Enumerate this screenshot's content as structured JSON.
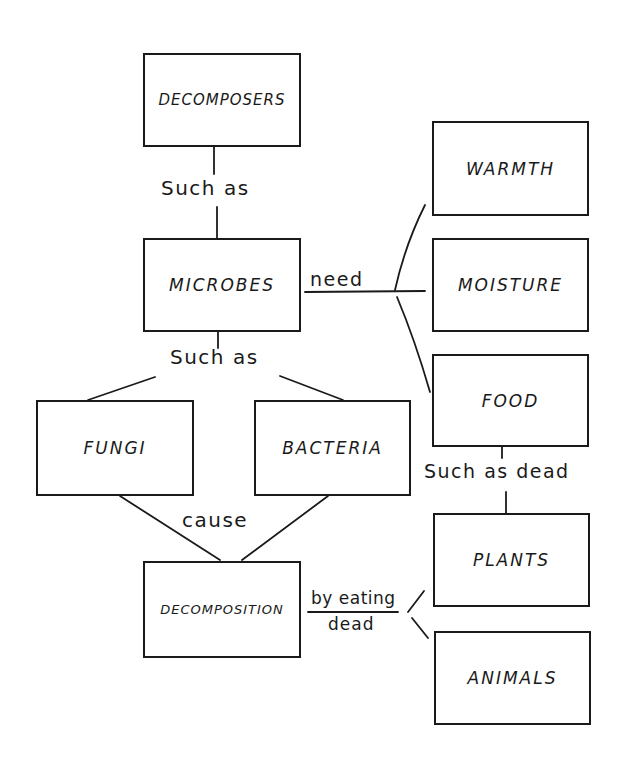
{
  "diagram": {
    "nodes": {
      "decomposers": "DECOMPOSERS",
      "microbes": "MICROBES",
      "warmth": "WARMTH",
      "moisture": "MOISTURE",
      "food": "FOOD",
      "fungi": "FUNGI",
      "bacteria": "BACTERIA",
      "decomposition": "DECOMPOSITION",
      "plants": "PLANTS",
      "animals": "ANIMALS"
    },
    "links": {
      "decomposers_microbes": "Such as",
      "microbes_fungi_bacteria": "Such as",
      "microbes_needs": "need",
      "food_plants": "Such as dead",
      "fungi_bacteria_decomposition": "cause",
      "decomposition_by": "by eating",
      "decomposition_dead": "dead"
    },
    "edges": [
      [
        "DECOMPOSERS",
        "Such as",
        "MICROBES"
      ],
      [
        "MICROBES",
        "need",
        "WARMTH"
      ],
      [
        "MICROBES",
        "need",
        "MOISTURE"
      ],
      [
        "MICROBES",
        "need",
        "FOOD"
      ],
      [
        "MICROBES",
        "Such as",
        "FUNGI"
      ],
      [
        "MICROBES",
        "Such as",
        "BACTERIA"
      ],
      [
        "FUNGI",
        "cause",
        "DECOMPOSITION"
      ],
      [
        "BACTERIA",
        "cause",
        "DECOMPOSITION"
      ],
      [
        "FOOD",
        "Such as dead",
        "PLANTS"
      ],
      [
        "DECOMPOSITION",
        "by eating dead",
        "PLANTS"
      ],
      [
        "DECOMPOSITION",
        "by eating dead",
        "ANIMALS"
      ]
    ],
    "colors": {
      "ink": "#1a1a1a",
      "background": "#ffffff"
    }
  }
}
